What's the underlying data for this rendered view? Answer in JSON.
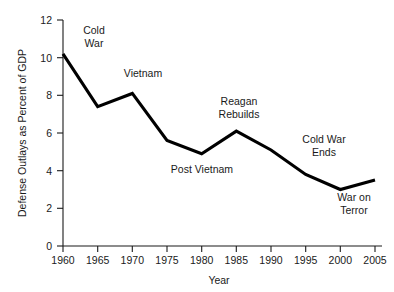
{
  "chart_data": {
    "type": "line",
    "title": "",
    "xlabel": "Year",
    "ylabel": "Defense Outlays as Percent of GDP",
    "x": [
      1960,
      1965,
      1970,
      1975,
      1980,
      1985,
      1990,
      1995,
      2000,
      2005
    ],
    "values": [
      10.2,
      7.4,
      8.1,
      5.6,
      4.9,
      6.1,
      5.1,
      3.8,
      3.0,
      3.5
    ],
    "series": [
      {
        "name": "Defense Outlays as Percent of GDP",
        "values": [
          10.2,
          7.4,
          8.1,
          5.6,
          4.9,
          6.1,
          5.1,
          3.8,
          3.0,
          3.5
        ]
      }
    ],
    "xlim": [
      1960,
      2005
    ],
    "ylim": [
      0,
      12
    ],
    "x_ticks": [
      "1960",
      "1965",
      "1970",
      "1975",
      "1980",
      "1985",
      "1990",
      "1995",
      "2000",
      "2005"
    ],
    "y_ticks": [
      "0",
      "2",
      "4",
      "6",
      "8",
      "10",
      "12"
    ],
    "grid": false,
    "legend": "none",
    "line_color": "#000000",
    "text_color": "#1a1a1a",
    "background_color": "#ffffff",
    "annotations": [
      {
        "id": "cold-war",
        "text_line1": "Cold",
        "text_line2": "War",
        "x": 94,
        "y": 34
      },
      {
        "id": "vietnam",
        "text_line1": "Vietnam",
        "text_line2": "",
        "x": 143,
        "y": 77
      },
      {
        "id": "post-vietnam",
        "text_line1": "Post Vietnam",
        "text_line2": "",
        "x": 202,
        "y": 173
      },
      {
        "id": "reagan-rebuilds",
        "text_line1": "Reagan",
        "text_line2": "Rebuilds",
        "x": 239,
        "y": 105
      },
      {
        "id": "cold-war-ends",
        "text_line1": "Cold War",
        "text_line2": "Ends",
        "x": 324,
        "y": 143
      },
      {
        "id": "war-on-terror",
        "text_line1": "War on",
        "text_line2": "Terror",
        "x": 354,
        "y": 201
      }
    ]
  }
}
